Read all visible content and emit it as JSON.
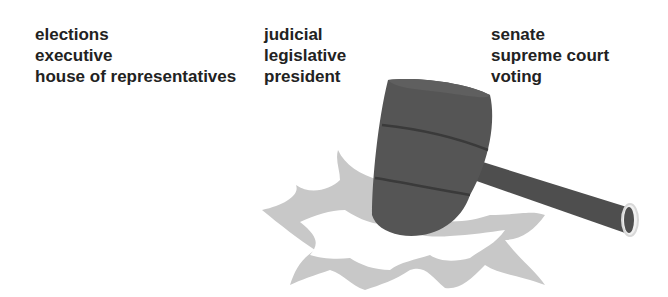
{
  "word_columns": [
    {
      "words": [
        "elections",
        "executive",
        "house of representatives"
      ]
    },
    {
      "words": [
        "judicial",
        "legislative",
        "president"
      ]
    },
    {
      "words": [
        "senate",
        "supreme court",
        "voting"
      ]
    }
  ],
  "illustration": {
    "subject": "gavel-striking",
    "colors": {
      "gavel": "#555555",
      "gavel_dark": "#3a3a3a",
      "burst": "#c8c8c8",
      "ring": "#e8e8e8"
    }
  }
}
